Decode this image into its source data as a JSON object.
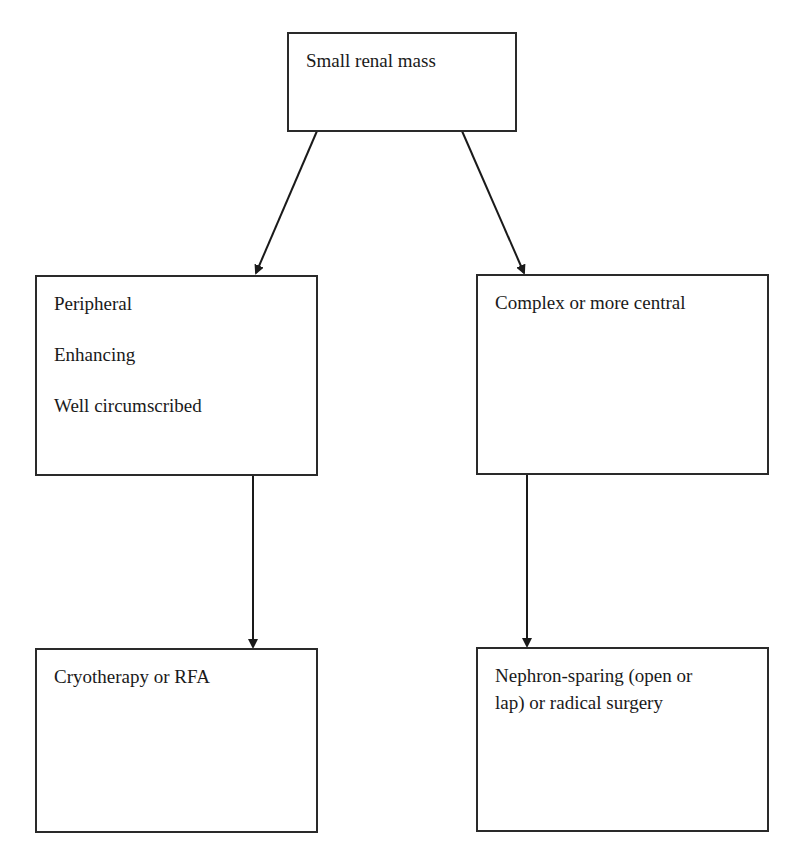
{
  "diagram": {
    "type": "flowchart",
    "nodes": {
      "root": {
        "lines": [
          "Small renal mass"
        ]
      },
      "left": {
        "lines": [
          "Peripheral",
          "Enhancing",
          "Well circumscribed"
        ]
      },
      "right": {
        "lines": [
          "Complex or more central"
        ]
      },
      "left_outcome": {
        "lines": [
          "Cryotherapy or RFA"
        ]
      },
      "right_outcome": {
        "lines": [
          "Nephron-sparing (open or",
          "lap) or radical surgery"
        ]
      }
    },
    "edges": [
      {
        "from": "root",
        "to": "left"
      },
      {
        "from": "root",
        "to": "right"
      },
      {
        "from": "left",
        "to": "left_outcome"
      },
      {
        "from": "right",
        "to": "right_outcome"
      }
    ],
    "colors": {
      "stroke": "#2a2a2a",
      "background": "#ffffff",
      "text": "#1a1a1a"
    }
  }
}
